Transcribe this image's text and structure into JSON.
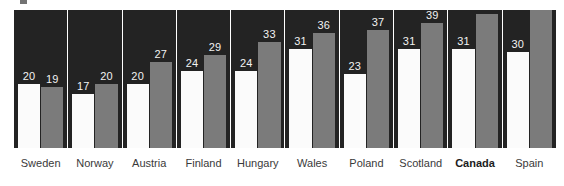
{
  "chart_data": {
    "type": "bar",
    "title": "",
    "subtitle": "",
    "xlabel": "",
    "ylabel": "",
    "grid": false,
    "legend_position": "none",
    "ylim": [
      0,
      43
    ],
    "categories": [
      "Sweden",
      "Norway",
      "Austria",
      "Finland",
      "Hungary",
      "Wales",
      "Poland",
      "Scotland",
      "Canada",
      "Spain"
    ],
    "highlight_category": "Canada",
    "series": [
      {
        "name": "series-1",
        "color": "#fbfbfb",
        "values": [
          20,
          17,
          20,
          24,
          24,
          31,
          23,
          31,
          31,
          30
        ]
      },
      {
        "name": "series-2",
        "color": "#7b7b7b",
        "values": [
          19,
          20,
          27,
          29,
          33,
          36,
          37,
          39,
          42,
          43
        ]
      }
    ],
    "panel_background": "#232323",
    "value_label_color": "#f2f2f2",
    "category_label_color": "#3a3a3a"
  }
}
